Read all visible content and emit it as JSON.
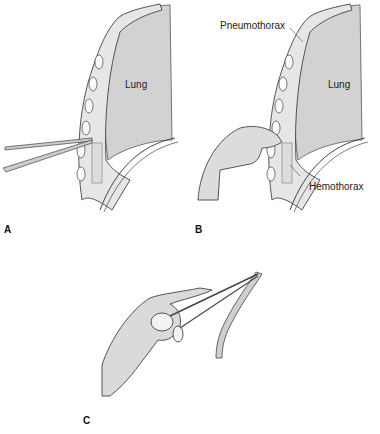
{
  "figure": {
    "panels": [
      {
        "id": "A",
        "label": "A",
        "organ_label": "Lung",
        "description": "Forceps inserted through chest wall intercostal space"
      },
      {
        "id": "B",
        "label": "B",
        "organ_label": "Lung",
        "annotations": [
          "Pneumothorax",
          "Hemothorax"
        ],
        "description": "Finger sweep through chest wall opening"
      },
      {
        "id": "C",
        "label": "C",
        "description": "Hand holding clamp grasping chest tube"
      }
    ]
  },
  "colors": {
    "lung_fill": "#d2d2d2",
    "wall_fill": "#e6e6e6",
    "line": "#4a4a4a",
    "skin": "#dcdcdc"
  }
}
